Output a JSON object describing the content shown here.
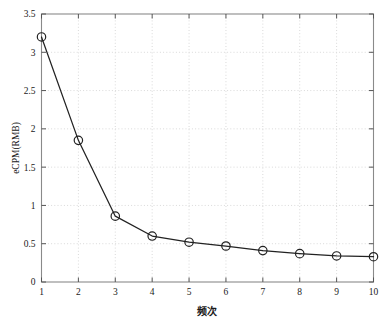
{
  "chart_data": {
    "type": "line",
    "title": "",
    "subtitle": "",
    "xlabel": "频次",
    "ylabel": "eCPM(RMB)",
    "x": [
      1,
      2,
      3,
      4,
      5,
      6,
      7,
      8,
      9,
      10
    ],
    "values": [
      3.2,
      1.85,
      0.86,
      0.6,
      0.52,
      0.47,
      0.41,
      0.37,
      0.34,
      0.33
    ],
    "series": [
      {
        "name": "eCPM",
        "values": [
          3.2,
          1.85,
          0.86,
          0.6,
          0.52,
          0.47,
          0.41,
          0.37,
          0.34,
          0.33
        ]
      }
    ],
    "xlim": [
      1,
      10
    ],
    "ylim": [
      0,
      3.5
    ],
    "xticks": [
      1,
      2,
      3,
      4,
      5,
      6,
      7,
      8,
      9,
      10
    ],
    "xtick_labels": [
      "1",
      "2",
      "3",
      "4",
      "5",
      "6",
      "7",
      "8",
      "9",
      "10"
    ],
    "yticks": [
      0,
      0.5,
      1,
      1.5,
      2,
      2.5,
      3,
      3.5
    ],
    "ytick_labels": [
      "0",
      "0.5",
      "1",
      "1.5",
      "2",
      "2.5",
      "3",
      "3.5"
    ],
    "grid": true,
    "grid_style": "dotted",
    "grid_color": "#d9d9d9",
    "legend": null,
    "legend_position": "none",
    "marker": "circle-open",
    "line_color": "#222222",
    "marker_color": "#222222",
    "background_color": "#ffffff",
    "frame_color": "#8a8a8a",
    "annotations": []
  }
}
